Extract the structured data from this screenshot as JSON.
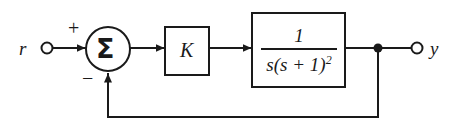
{
  "diagram": {
    "type": "control-system-block-diagram",
    "background_color": "#ffffff",
    "line_color": "#1a1a1a"
  },
  "signals": {
    "input_label": "r",
    "output_label": "y"
  },
  "summing_junction": {
    "symbol": "Σ",
    "input_sign": "+",
    "feedback_sign": "−"
  },
  "blocks": {
    "gain": {
      "label": "K",
      "name": "gain-block"
    },
    "plant": {
      "numerator": "1",
      "denominator_base": "s(s + 1)",
      "denominator_exponent": "2",
      "expression": "1/(s(s + 1)^2)",
      "name": "transfer-function-block"
    }
  },
  "nodes": {
    "takeoff_point_label": "output takeoff point"
  }
}
